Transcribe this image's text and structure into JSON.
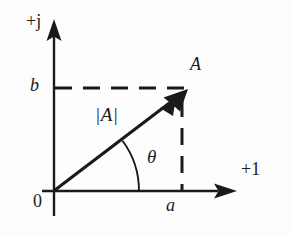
{
  "figure": {
    "background_color": "#fdfdfd",
    "ink_color": "#1a1a1a",
    "width": 292,
    "height": 235
  },
  "axes": {
    "vertical": {
      "label": "+j",
      "meaning": "imaginary-axis",
      "x": 54,
      "top_y": 20,
      "bottom_y": 216
    },
    "horizontal": {
      "label": "+1",
      "meaning": "real-axis",
      "y": 191,
      "left_x": 42,
      "right_x": 236
    },
    "origin": {
      "label": "0",
      "x": 54,
      "y": 191
    }
  },
  "vector": {
    "label": "A",
    "magnitude_label": "|A|",
    "angle_label": "θ",
    "tail": {
      "x": 55,
      "y": 190
    },
    "tip": {
      "x": 186,
      "y": 91
    }
  },
  "projections": {
    "imaginary": {
      "label": "b",
      "y": 88,
      "from_x": 54,
      "to_x": 186,
      "style": "dashed"
    },
    "real": {
      "label": "a",
      "x": 182,
      "from_y": 98,
      "to_y": 190,
      "style": "dashed"
    }
  },
  "arc": {
    "name": "angle-arc",
    "radius": 84,
    "start_deg": 0,
    "end_deg": 37
  }
}
